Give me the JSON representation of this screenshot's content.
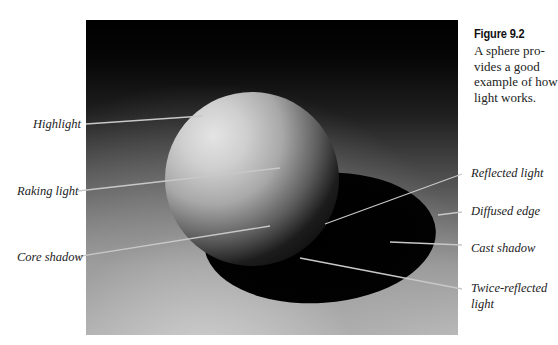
{
  "figure": {
    "number": "Figure 9.2",
    "caption": "A sphere provides a good example of how light works.",
    "caption_lines": [
      "A sphere pro-",
      "vides a good",
      "example of how",
      "light works."
    ],
    "colors": {
      "background": "#ffffff",
      "leader_line": "#c8c8c8",
      "label_text": "#222222"
    },
    "labels": {
      "highlight": "Highlight",
      "raking_light": "Raking light",
      "core_shadow": "Core shadow",
      "reflected_light": "Reflected light",
      "diffused_edge": "Diffused edge",
      "cast_shadow": "Cast shadow",
      "twice_reflected_line1": "Twice-reflected",
      "twice_reflected_line2": "light"
    }
  }
}
